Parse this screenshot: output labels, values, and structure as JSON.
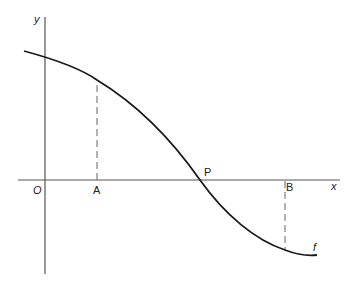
{
  "diagram": {
    "type": "function-graph",
    "axes": {
      "x_label": "x",
      "y_label": "y",
      "origin_label": "O",
      "color": "#555555"
    },
    "curve": {
      "label": "f",
      "color": "#1a1a1a",
      "description": "Decreasing curve crossing the x-axis at P; positive over A, negative over B"
    },
    "points": [
      {
        "label": "A",
        "on": "x-axis",
        "dashed_to_curve": true
      },
      {
        "label": "P",
        "on": "x-axis",
        "note": "curve intersects x-axis"
      },
      {
        "label": "B",
        "on": "x-axis",
        "dashed_to_curve": true
      }
    ],
    "dash_color": "#666666"
  }
}
